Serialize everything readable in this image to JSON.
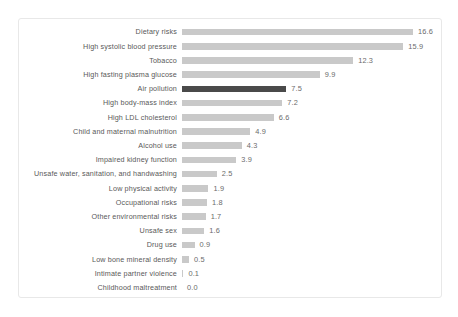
{
  "chart_data": {
    "type": "bar",
    "orientation": "horizontal",
    "title": "",
    "subtitle": "",
    "xlabel": "",
    "ylabel": "",
    "grid": false,
    "legend": false,
    "xlim": [
      0,
      16.6
    ],
    "value_format": "one-decimal",
    "highlight_category": "Air pollution",
    "colors": {
      "bar": "#c9c9c9",
      "bar_highlight": "#4a4a4a",
      "label_text": "#595959",
      "value_text": "#6b6b6b",
      "frame_border": "#e8e8e8",
      "background": "#ffffff"
    },
    "categories": [
      "Dietary risks",
      "High systolic blood pressure",
      "Tobacco",
      "High fasting plasma glucose",
      "Air pollution",
      "High body-mass index",
      "High LDL cholesterol",
      "Child and maternal malnutrition",
      "Alcohol use",
      "Impaired kidney function",
      "Unsafe water, sanitation, and handwashing",
      "Low physical activity",
      "Occupational risks",
      "Other environmental risks",
      "Unsafe sex",
      "Drug use",
      "Low bone mineral density",
      "Intimate partner violence",
      "Childhood maltreatment"
    ],
    "values": [
      16.6,
      15.9,
      12.3,
      9.9,
      7.5,
      7.2,
      6.6,
      4.9,
      4.3,
      3.9,
      2.5,
      1.9,
      1.8,
      1.7,
      1.6,
      0.9,
      0.5,
      0.1,
      0.0
    ],
    "value_labels": [
      "16.6",
      "15.9",
      "12.3",
      "9.9",
      "7.5",
      "7.2",
      "6.6",
      "4.9",
      "4.3",
      "3.9",
      "2.5",
      "1.9",
      "1.8",
      "1.7",
      "1.6",
      "0.9",
      "0.5",
      "0.1",
      "0.0"
    ]
  }
}
